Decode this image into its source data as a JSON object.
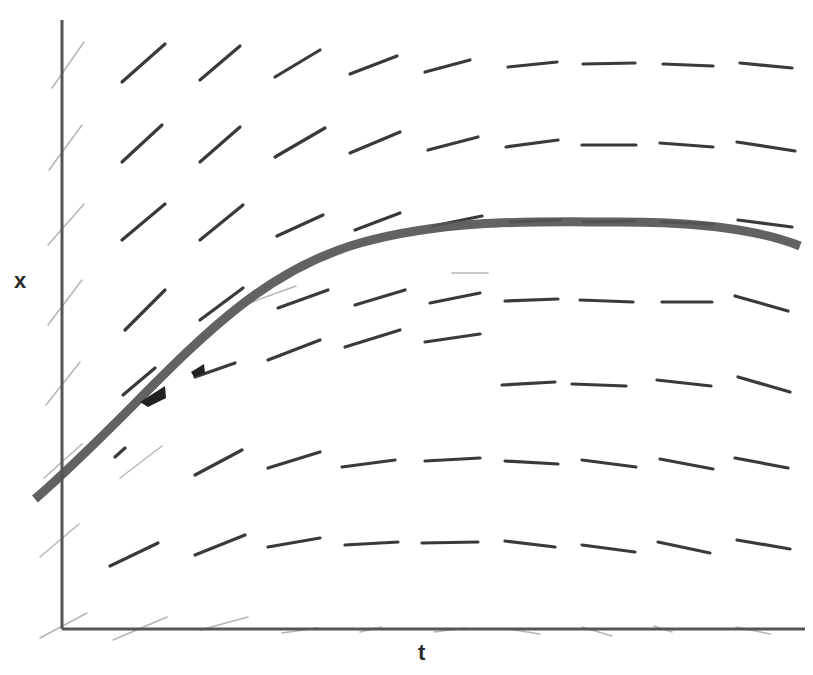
{
  "diagram": {
    "type": "slope_field_with_solution_curve",
    "axis_labels": {
      "horizontal": "t",
      "vertical": "x"
    },
    "colors": {
      "background": "#ffffff",
      "axis": "#555555",
      "slope_segment": "#3a3a3a",
      "faint_segment": "#b5b5b5",
      "solution_curve": "#555555",
      "arrow_marks": "#222222"
    },
    "axes": {
      "origin": [
        62,
        629
      ],
      "x_axis_end": [
        805,
        629
      ],
      "y_axis_top": [
        62,
        20
      ]
    },
    "slope_segments": [
      [
        122,
        82,
        165,
        44
      ],
      [
        200,
        80,
        240,
        46
      ],
      [
        275,
        77,
        320,
        50
      ],
      [
        350,
        74,
        397,
        56
      ],
      [
        425,
        72,
        470,
        60
      ],
      [
        508,
        67,
        557,
        62
      ],
      [
        583,
        64,
        635,
        63
      ],
      [
        663,
        64,
        713,
        66
      ],
      [
        740,
        63,
        792,
        68
      ],
      [
        122,
        162,
        162,
        125
      ],
      [
        200,
        162,
        240,
        127
      ],
      [
        275,
        157,
        325,
        128
      ],
      [
        350,
        153,
        400,
        132
      ],
      [
        428,
        150,
        478,
        137
      ],
      [
        506,
        147,
        558,
        140
      ],
      [
        582,
        145,
        636,
        145
      ],
      [
        660,
        143,
        713,
        147
      ],
      [
        737,
        142,
        795,
        151
      ],
      [
        122,
        240,
        165,
        204
      ],
      [
        200,
        240,
        243,
        205
      ],
      [
        277,
        236,
        323,
        215
      ],
      [
        355,
        230,
        400,
        213
      ],
      [
        433,
        226,
        482,
        216
      ],
      [
        510,
        222,
        560,
        220
      ],
      [
        583,
        222,
        635,
        221
      ],
      [
        662,
        222,
        713,
        224
      ],
      [
        738,
        220,
        792,
        227
      ],
      [
        125,
        330,
        165,
        290
      ],
      [
        200,
        320,
        243,
        288
      ],
      [
        278,
        308,
        328,
        290
      ],
      [
        355,
        305,
        405,
        290
      ],
      [
        430,
        303,
        480,
        293
      ],
      [
        505,
        301,
        558,
        299
      ],
      [
        580,
        300,
        633,
        302
      ],
      [
        662,
        302,
        712,
        302
      ],
      [
        735,
        296,
        788,
        311
      ],
      [
        123,
        395,
        155,
        368
      ],
      [
        195,
        377,
        235,
        363
      ],
      [
        268,
        360,
        320,
        340
      ],
      [
        345,
        347,
        400,
        330
      ],
      [
        425,
        342,
        480,
        334
      ],
      [
        502,
        385,
        555,
        382
      ],
      [
        572,
        384,
        626,
        386
      ],
      [
        657,
        380,
        711,
        386
      ],
      [
        738,
        377,
        790,
        392
      ],
      [
        115,
        457,
        125,
        448
      ],
      [
        195,
        475,
        242,
        450
      ],
      [
        268,
        468,
        320,
        452
      ],
      [
        342,
        467,
        395,
        460
      ],
      [
        425,
        461,
        480,
        458
      ],
      [
        505,
        461,
        558,
        464
      ],
      [
        582,
        460,
        636,
        467
      ],
      [
        660,
        459,
        713,
        469
      ],
      [
        735,
        458,
        788,
        468
      ],
      [
        110,
        566,
        158,
        543
      ],
      [
        195,
        555,
        245,
        535
      ],
      [
        268,
        547,
        320,
        538
      ],
      [
        345,
        545,
        398,
        542
      ],
      [
        422,
        543,
        478,
        542
      ],
      [
        505,
        541,
        555,
        547
      ],
      [
        582,
        545,
        635,
        552
      ],
      [
        658,
        542,
        710,
        553
      ],
      [
        737,
        540,
        790,
        549
      ]
    ],
    "faint_segments": [
      [
        52,
        88,
        84,
        42
      ],
      [
        49,
        170,
        82,
        125
      ],
      [
        48,
        245,
        84,
        204
      ],
      [
        48,
        325,
        82,
        280
      ],
      [
        46,
        405,
        80,
        362
      ],
      [
        44,
        478,
        82,
        444
      ],
      [
        40,
        557,
        79,
        524
      ],
      [
        40,
        638,
        87,
        613
      ],
      [
        120,
        478,
        162,
        446
      ],
      [
        113,
        640,
        167,
        617
      ],
      [
        200,
        630,
        248,
        617
      ],
      [
        282,
        633,
        318,
        628
      ],
      [
        360,
        632,
        382,
        627
      ],
      [
        434,
        632,
        465,
        628
      ],
      [
        508,
        629,
        540,
        634
      ],
      [
        582,
        627,
        612,
        636
      ],
      [
        654,
        626,
        672,
        632
      ],
      [
        736,
        627,
        770,
        634
      ],
      [
        252,
        302,
        296,
        286
      ],
      [
        452,
        273,
        488,
        273
      ]
    ],
    "solution_curve": {
      "path": "M 35 499 C 160 390, 230 280, 360 243 C 450 218, 540 222, 620 222 C 700 222, 760 230, 800 246",
      "stroke_width": 9
    },
    "arrow_marks": [
      {
        "points": "140,402 165,386 166,398 148,407",
        "label": "arrow-mark-1"
      },
      {
        "points": "191,372 204,364 205,373 194,377",
        "label": "arrow-mark-2"
      }
    ]
  }
}
